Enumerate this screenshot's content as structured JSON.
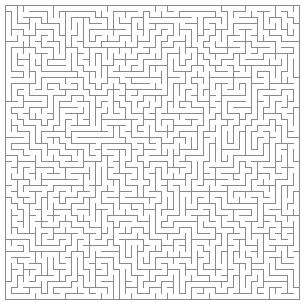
{
  "page": {
    "kind": "maze-puzzle",
    "width": 308,
    "height": 305,
    "background_color": "#ffffff"
  },
  "maze": {
    "name": "rectangular-perfect-maze",
    "cols": 49,
    "rows": 49,
    "cell_size": 6,
    "origin_x": 5,
    "origin_y": 5,
    "wall_color": "#8a8a8a",
    "wall_thickness": 1,
    "passage_color": "#ffffff",
    "border_closed": true,
    "algorithm": "depth-first-search",
    "seed": 20240607,
    "entrance": null,
    "exit": null,
    "solution_shown": false,
    "labels": []
  }
}
